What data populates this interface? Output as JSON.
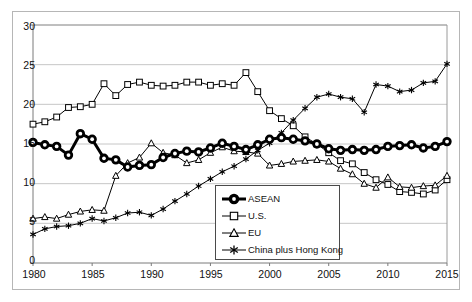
{
  "chart_data": {
    "type": "line",
    "title": "",
    "xlabel": "",
    "ylabel": "",
    "xlim": [
      1980,
      2015
    ],
    "ylim": [
      0,
      30
    ],
    "grid": true,
    "legend_position": "lower-center-right",
    "x": [
      1980,
      1981,
      1982,
      1983,
      1984,
      1985,
      1986,
      1987,
      1988,
      1989,
      1990,
      1991,
      1992,
      1993,
      1994,
      1995,
      1996,
      1997,
      1998,
      1999,
      2000,
      2001,
      2002,
      2003,
      2004,
      2005,
      2006,
      2007,
      2008,
      2009,
      2010,
      2011,
      2012,
      2013,
      2014,
      2015
    ],
    "xticks": [
      1980,
      1985,
      1990,
      1995,
      2000,
      2005,
      2010,
      2015
    ],
    "yticks": [
      0,
      5,
      10,
      15,
      20,
      25,
      30
    ],
    "series": [
      {
        "name": "ASEAN",
        "marker": "circle-filled-ring",
        "line_width": 3,
        "color": "#000000",
        "values": [
          15.2,
          14.9,
          14.7,
          13.6,
          16.3,
          15.6,
          13.2,
          13.0,
          12.1,
          12.3,
          12.4,
          13.3,
          13.8,
          14.1,
          14.0,
          14.5,
          15.1,
          14.7,
          14.3,
          14.9,
          15.6,
          15.8,
          15.6,
          15.4,
          15.0,
          14.4,
          14.2,
          14.3,
          14.2,
          14.3,
          14.7,
          14.8,
          14.9,
          14.5,
          14.7,
          15.3
        ]
      },
      {
        "name": "U.S.",
        "marker": "square-open",
        "line_width": 1,
        "color": "#000000",
        "values": [
          17.5,
          17.8,
          18.4,
          19.6,
          19.7,
          20.0,
          22.6,
          21.1,
          22.5,
          22.8,
          22.4,
          22.3,
          22.4,
          22.8,
          22.8,
          22.4,
          22.6,
          22.4,
          24.0,
          21.6,
          19.2,
          18.2,
          17.3,
          15.9,
          15.0,
          13.9,
          12.9,
          12.5,
          11.4,
          10.5,
          9.9,
          9.0,
          8.9,
          8.7,
          9.2,
          10.5
        ]
      },
      {
        "name": "EU",
        "marker": "triangle-open",
        "line_width": 1,
        "color": "#000000",
        "values": [
          5.6,
          5.8,
          5.6,
          6.1,
          6.5,
          6.7,
          6.6,
          11.0,
          12.6,
          13.3,
          15.1,
          13.9,
          13.6,
          12.6,
          13.0,
          13.9,
          14.6,
          14.1,
          14.0,
          13.8,
          12.3,
          12.5,
          12.8,
          12.9,
          13.0,
          12.8,
          11.9,
          11.2,
          10.0,
          9.5,
          10.8,
          9.6,
          9.5,
          9.7,
          9.8,
          11.0
        ]
      },
      {
        "name": "China plus Hong Kong",
        "marker": "asterisk",
        "line_width": 1,
        "color": "#000000",
        "values": [
          3.6,
          4.3,
          4.6,
          4.7,
          5.0,
          5.6,
          5.3,
          5.7,
          6.3,
          6.4,
          6.0,
          6.8,
          7.8,
          8.7,
          9.7,
          10.6,
          11.5,
          12.2,
          13.1,
          14.2,
          15.1,
          16.4,
          18.0,
          19.5,
          20.9,
          21.3,
          20.9,
          20.7,
          19.0,
          22.5,
          22.3,
          21.6,
          21.8,
          22.7,
          22.9,
          25.1
        ]
      }
    ]
  },
  "axis": {
    "y_tick_labels": [
      "30",
      "25",
      "20",
      "15",
      "10",
      "5",
      "0"
    ],
    "x_tick_labels": [
      "1980",
      "1985",
      "1990",
      "1995",
      "2000",
      "2005",
      "2010",
      "2015"
    ]
  },
  "legend": {
    "items": [
      {
        "label": "ASEAN",
        "marker": "circle-filled-ring"
      },
      {
        "label": "U.S.",
        "marker": "square-open"
      },
      {
        "label": "EU",
        "marker": "triangle-open"
      },
      {
        "label": "China plus Hong Kong",
        "marker": "asterisk"
      }
    ]
  }
}
